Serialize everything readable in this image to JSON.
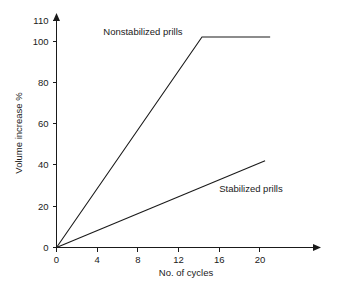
{
  "chart_data": {
    "type": "line",
    "title": "",
    "xlabel": "No. of cycles",
    "ylabel": "Volume increase %",
    "xlim": [
      0,
      23
    ],
    "ylim": [
      0,
      110
    ],
    "grid": false,
    "legend_position": "inline-annotations",
    "xticks": [
      0,
      4,
      8,
      12,
      16,
      20
    ],
    "xtick_labels": [
      "0",
      "4",
      "8",
      "12",
      "16",
      "20"
    ],
    "yticks": [
      0,
      20,
      40,
      60,
      80,
      100,
      110
    ],
    "ytick_labels": [
      "0",
      "20",
      "40",
      "60",
      "80",
      "100",
      "110"
    ],
    "series": [
      {
        "name": "Nonstabilized prills",
        "x": [
          0,
          14.3,
          21.0
        ],
        "values": [
          0,
          102,
          102
        ]
      },
      {
        "name": "Stabilized prills",
        "x": [
          0,
          20.5
        ],
        "values": [
          0,
          42
        ]
      }
    ],
    "annotations": [
      {
        "text": "Nonstabilized prills",
        "x": 4.6,
        "y": 103
      },
      {
        "text": "Stabilized prills",
        "x": 16.0,
        "y": 27
      }
    ],
    "colors": {
      "line": "#1a1a1a",
      "axis": "#1a1a1a",
      "text": "#1a1a1a",
      "background": "#ffffff"
    }
  }
}
